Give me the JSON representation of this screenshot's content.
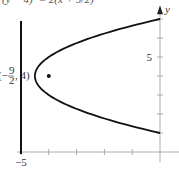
{
  "chart_data": {
    "type": "line",
    "title": "(y − 4)² = 2(x + 9/2)",
    "xlabel": "x",
    "ylabel": "y",
    "xlim": [
      -5,
      0.6
    ],
    "ylim": [
      -0.6,
      7.2
    ],
    "x_ticks": [
      -5,
      -4,
      -3,
      -2,
      -1,
      0
    ],
    "x_tick_labels": [
      {
        "value": -5,
        "label": "−5"
      }
    ],
    "y_ticks": [
      1,
      2,
      3,
      4,
      5,
      6,
      7
    ],
    "y_tick_labels": [
      {
        "value": 5,
        "label": "5"
      }
    ],
    "grid": false,
    "series": [
      {
        "name": "parabola",
        "equation": "(y-4)^2 = 2(x+4.5)",
        "vertex": [
          -4.5,
          4
        ],
        "y_range": [
          1,
          7
        ]
      },
      {
        "name": "directrix",
        "equation": "x = -5",
        "y_range": [
          -0.1,
          6.9
        ]
      }
    ],
    "points": [
      {
        "name": "focus",
        "x": -4,
        "y": 4
      }
    ],
    "annotations": [
      {
        "text": "(−9/2, 4)",
        "at": [
          -4.5,
          4
        ],
        "numerator": "9",
        "denominator": "2",
        "prefix": "(−",
        "suffix": ", 4)"
      }
    ]
  }
}
